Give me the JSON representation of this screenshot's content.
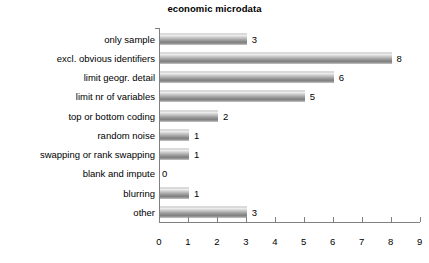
{
  "chart_data": {
    "type": "bar",
    "orientation": "horizontal",
    "title": "economic microdata",
    "xlabel": "",
    "ylabel": "",
    "xlim": [
      0,
      9
    ],
    "grid": false,
    "legend": false,
    "categories": [
      "only sample",
      "excl. obvious identifiers",
      "limit geogr. detail",
      "limit nr of variables",
      "top or bottom coding",
      "random noise",
      "swapping or rank swapping",
      "blank and impute",
      "blurring",
      "other"
    ],
    "values": [
      3,
      8,
      6,
      5,
      2,
      1,
      1,
      0,
      1,
      3
    ],
    "value_labels": [
      "3",
      "8",
      "6",
      "5",
      "2",
      "1",
      "1",
      "0",
      "1",
      "3"
    ],
    "xticks": [
      0,
      1,
      2,
      3,
      4,
      5,
      6,
      7,
      8,
      9
    ],
    "xtick_labels": [
      "0",
      "1",
      "2",
      "3",
      "4",
      "5",
      "6",
      "7",
      "8",
      "9"
    ],
    "colors": {
      "bar_top": "#fdfdfd",
      "bar_bottom": "#7a7a7a",
      "axis": "#808080",
      "text": "#000000",
      "background": "#ffffff"
    }
  }
}
